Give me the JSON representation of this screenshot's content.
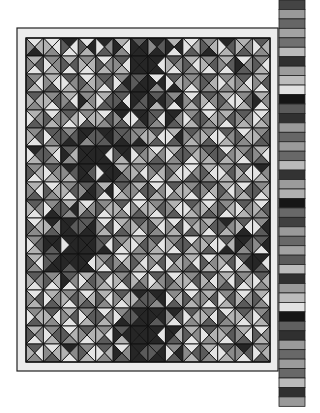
{
  "palette": [
    "#e4e4e4",
    "#b2b2b2",
    "#8a8a8a",
    "#5a5a5a",
    "#262626"
  ],
  "quilt": {
    "border": {
      "x": 17,
      "y": 28,
      "w": 261,
      "h": 343,
      "fill": "#ececec"
    },
    "grid": {
      "x": 26,
      "y": 38,
      "cols": 14,
      "rows": 18,
      "cw": 17.43,
      "ch": 18
    },
    "cells": [
      [
        "0142",
        "0021",
        "4003",
        "0413",
        "4230",
        "1024",
        "3444",
        "4342",
        "1404",
        "0130",
        "2143",
        "4310",
        "1231",
        "3120"
      ],
      [
        "1302",
        "2210",
        "1303",
        "2101",
        "0213",
        "3012",
        "4444",
        "4044",
        "3201",
        "1023",
        "2301",
        "1302",
        "0234",
        "2013"
      ],
      [
        "2013",
        "1032",
        "3210",
        "0123",
        "3302",
        "2430",
        "3443",
        "0424",
        "3140",
        "2202",
        "3123",
        "2120",
        "3012",
        "1302"
      ],
      [
        "3121",
        "2301",
        "1032",
        "2214",
        "1330",
        "3043",
        "4334",
        "3414",
        "2403",
        "0312",
        "3201",
        "1023",
        "2310",
        "1204"
      ],
      [
        "1230",
        "0213",
        "3102",
        "2130",
        "0321",
        "4032",
        "4430",
        "3023",
        "4234",
        "2310",
        "0123",
        "1302",
        "3212",
        "0210"
      ],
      [
        "2301",
        "3320",
        "2343",
        "4324",
        "4433",
        "3343",
        "2142",
        "3031",
        "1430",
        "3212",
        "2031",
        "3210",
        "0123",
        "2331"
      ],
      [
        "4310",
        "1023",
        "3124",
        "4444",
        "4044",
        "4413",
        "3210",
        "0231",
        "1320",
        "2103",
        "3312",
        "0213",
        "2301",
        "1032"
      ],
      [
        "2103",
        "3210",
        "4312",
        "4344",
        "4440",
        "1234",
        "2031",
        "3102",
        "2013",
        "0230",
        "1023",
        "2310",
        "3021",
        "4210"
      ],
      [
        "1032",
        "0123",
        "2301",
        "3442",
        "1403",
        "3210",
        "1302",
        "0213",
        "3120",
        "2301",
        "3102",
        "1023",
        "0312",
        "2103"
      ],
      [
        "3201",
        "2340",
        "1423",
        "0231",
        "2103",
        "3021",
        "0132",
        "2301",
        "1032",
        "3210",
        "0231",
        "2103",
        "3210",
        "0321"
      ],
      [
        "0123",
        "4231",
        "4344",
        "3443",
        "0312",
        "1230",
        "3201",
        "1023",
        "0312",
        "2130",
        "1302",
        "4213",
        "3041",
        "2430"
      ],
      [
        "2310",
        "4434",
        "4440",
        "4444",
        "3043",
        "2103",
        "1320",
        "3012",
        "2301",
        "0213",
        "2031",
        "3140",
        "4324",
        "3402"
      ],
      [
        "1023",
        "3443",
        "4434",
        "4044",
        "2301",
        "0132",
        "2013",
        "1302",
        "3120",
        "1032",
        "0213",
        "2301",
        "3410",
        "4034"
      ],
      [
        "3201",
        "2103",
        "3204",
        "1320",
        "3012",
        "2301",
        "0231",
        "3210",
        "0123",
        "2301",
        "3021",
        "1032",
        "2103",
        "3120"
      ],
      [
        "0312",
        "1230",
        "2301",
        "0132",
        "1023",
        "3102",
        "4331",
        "4423",
        "2130",
        "0213",
        "1302",
        "2310",
        "0231",
        "1023"
      ],
      [
        "2130",
        "3021",
        "1302",
        "2310",
        "0213",
        "2340",
        "4443",
        "4434",
        "4302",
        "3120",
        "2031",
        "0123",
        "3201",
        "2310"
      ],
      [
        "1203",
        "2310",
        "0123",
        "3102",
        "2031",
        "3414",
        "4444",
        "4044",
        "4134",
        "1203",
        "3120",
        "2301",
        "1032",
        "0213"
      ],
      [
        "3021",
        "0132",
        "4201",
        "2013",
        "3120",
        "0234",
        "4344",
        "3443",
        "2430",
        "0312",
        "1023",
        "3210",
        "4302",
        "2130"
      ]
    ],
    "line_color": "#111111",
    "border_line_color": "#222222"
  },
  "swatch_strip": {
    "x": 279,
    "y": 0,
    "w": 26,
    "seg_h": 9.45,
    "shades": [
      "#444444",
      "#9a9a9a",
      "#666666",
      "#a3a3a3",
      "#707070",
      "#bbbbbb",
      "#303030",
      "#9c9c9c",
      "#bdbdbd",
      "#e2e2e2",
      "#151515",
      "#5a5a5a",
      "#303030",
      "#9a9a9a",
      "#666666",
      "#9a9a9a",
      "#686868",
      "#bababa",
      "#333333",
      "#9b9b9b",
      "#b0b0b0",
      "#161616",
      "#686868",
      "#404040",
      "#9a9a9a",
      "#686868",
      "#a2a2a2",
      "#5a5a5a",
      "#bcbcbc",
      "#303030",
      "#9a9a9a",
      "#bcbcbc",
      "#e2e2e2",
      "#151515",
      "#606060",
      "#303030",
      "#9a9a9a",
      "#686868",
      "#9c9c9c",
      "#686868",
      "#bbbbbb",
      "#303030",
      "#9a9a9a"
    ]
  }
}
